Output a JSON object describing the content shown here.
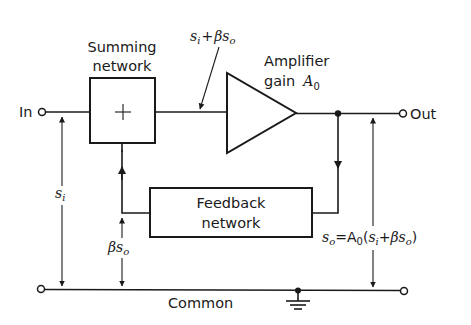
{
  "diagram": {
    "blocks": {
      "summing": {
        "title_line1": "Summing",
        "title_line2": "network",
        "symbol": "+"
      },
      "amplifier": {
        "title_line1": "Amplifier",
        "title_line2": "gain",
        "gain_symbol": "A",
        "gain_sub": "0"
      },
      "feedback": {
        "title_line1": "Feedback",
        "title_line2": "network"
      }
    },
    "terminals": {
      "input": "In",
      "output": "Out",
      "common": "Common"
    },
    "signals": {
      "amp_input": {
        "s": "s",
        "s_sub": "i",
        "plus": "+",
        "beta": "β",
        "s2": "s",
        "s2_sub": "o"
      },
      "input_voltage": {
        "s": "s",
        "sub": "i"
      },
      "feedback_signal": {
        "beta": "β",
        "s": "s",
        "sub": "o"
      },
      "output_equation": {
        "lhs": "s",
        "lhs_sub": "o",
        "eq": "=",
        "A": "A",
        "A_sub": "0",
        "open": "(",
        "s": "s",
        "s_sub": "i",
        "plus": "+",
        "beta": "β",
        "s2": "s",
        "s2_sub": "o",
        "close": ")"
      }
    },
    "colors": {
      "ink": "#1a1a1a",
      "background": "#ffffff"
    }
  }
}
